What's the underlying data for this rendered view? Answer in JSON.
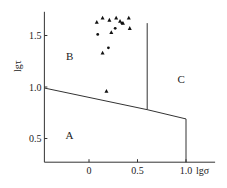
{
  "chart_data": {
    "type": "scatter",
    "title": "",
    "xlabel": "lgσ",
    "ylabel": "lgτ",
    "xlim": [
      -0.46,
      1.3
    ],
    "ylim": [
      0.27,
      1.73
    ],
    "x_ticks": [
      "0",
      "0.5",
      "1.0"
    ],
    "y_ticks": [
      "0.5",
      "1.0",
      "1.5"
    ],
    "grid": false,
    "regions": [
      {
        "label": "A",
        "x": -0.2,
        "y": 0.5
      },
      {
        "label": "B",
        "x": -0.2,
        "y": 1.26
      },
      {
        "label": "C",
        "x": 0.95,
        "y": 1.04
      }
    ],
    "boundaries": [
      {
        "name": "A-B/C boundary",
        "points": [
          [
            -0.46,
            0.99
          ],
          [
            0.6,
            0.78
          ],
          [
            1.0,
            0.69
          ]
        ]
      },
      {
        "name": "B-C boundary",
        "points": [
          [
            0.6,
            0.78
          ],
          [
            0.6,
            1.62
          ]
        ]
      },
      {
        "name": "A-C boundary",
        "points": [
          [
            1.0,
            0.69
          ],
          [
            1.0,
            0.27
          ]
        ]
      }
    ],
    "series": [
      {
        "name": "triangles",
        "marker": "triangle",
        "points": [
          [
            0.08,
            1.63
          ],
          [
            0.14,
            1.67
          ],
          [
            0.21,
            1.65
          ],
          [
            0.28,
            1.67
          ],
          [
            0.32,
            1.64
          ],
          [
            0.35,
            1.62
          ],
          [
            0.41,
            1.67
          ],
          [
            0.42,
            1.57
          ],
          [
            0.23,
            1.53
          ],
          [
            0.14,
            1.33
          ],
          [
            0.18,
            0.96
          ]
        ]
      },
      {
        "name": "dots",
        "marker": "circle",
        "points": [
          [
            0.27,
            1.57
          ],
          [
            0.09,
            1.51
          ],
          [
            0.2,
            1.38
          ],
          [
            0.34,
            1.62
          ]
        ]
      }
    ]
  }
}
